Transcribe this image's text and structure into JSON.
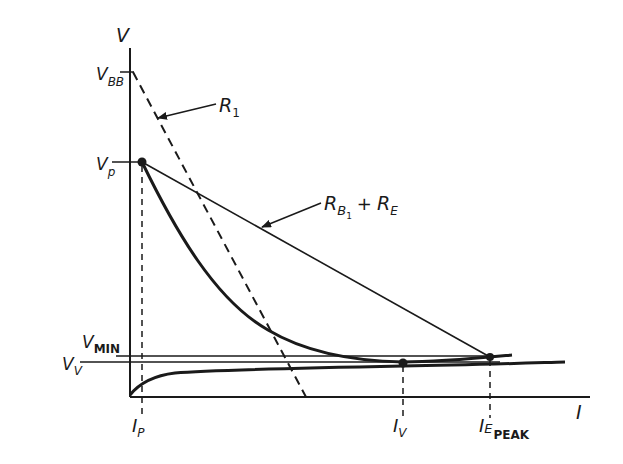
{
  "figure": {
    "axes": {
      "y_label": "V",
      "x_label": "I"
    },
    "y_ticks": {
      "vbb": {
        "main": "V",
        "sub": "BB"
      },
      "vp": {
        "main": "V",
        "sub": "p"
      },
      "vmin": {
        "main": "V",
        "sub": "MIN"
      },
      "vv": {
        "main": "V",
        "sub": "V"
      }
    },
    "x_ticks": {
      "ip": {
        "main": "I",
        "sub": "P"
      },
      "iv": {
        "main": "I",
        "sub": "V"
      },
      "iepeak": {
        "main": "I",
        "sub": "E",
        "subsub": "PEAK"
      }
    },
    "annotations": {
      "r1": {
        "main": "R",
        "sub": "1"
      },
      "rb1_re": {
        "main": "R",
        "sub": "B",
        "subsub": "1",
        "plus": "+",
        "main2": "R",
        "sub2": "E"
      }
    },
    "colors": {
      "ink": "#1a1a1a",
      "background": "#ffffff"
    }
  }
}
